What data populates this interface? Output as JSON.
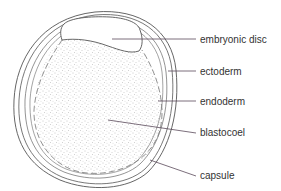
{
  "diagram": {
    "colors": {
      "outline": "#555555",
      "leader_line": "#5a4a5a",
      "stipple": "#9a9a9a",
      "label_text": "#333333",
      "background": "#ffffff"
    },
    "labels": [
      {
        "id": "embryonic-disc",
        "text": "embryonic disc",
        "x": 200,
        "y": 34
      },
      {
        "id": "ectoderm",
        "text": "ectoderm",
        "x": 200,
        "y": 66
      },
      {
        "id": "endoderm",
        "text": "endoderm",
        "x": 200,
        "y": 96
      },
      {
        "id": "blastocoel",
        "text": "blastocoel",
        "x": 200,
        "y": 127
      },
      {
        "id": "capsule",
        "text": "capsule",
        "x": 200,
        "y": 167
      }
    ]
  }
}
